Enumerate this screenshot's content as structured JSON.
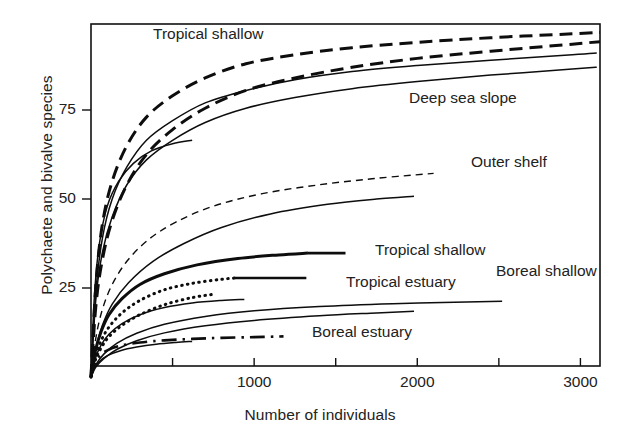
{
  "chart_data": {
    "type": "line",
    "title": "",
    "xlabel": "Number of individuals",
    "ylabel": "Polychaete and bivalve species",
    "xlim": [
      0,
      3120
    ],
    "ylim": [
      0,
      99
    ],
    "grid": false,
    "legend_position": "inline-annotations",
    "xticks": [
      {
        "value": 1000,
        "label": "1000"
      },
      {
        "value": 2000,
        "label": "2000"
      },
      {
        "value": 3000,
        "label": "3000"
      }
    ],
    "xminorticks": [
      500,
      1500,
      2500
    ],
    "yticks": [
      {
        "value": 25,
        "label": "25"
      },
      {
        "value": 50,
        "label": "50"
      },
      {
        "value": 75,
        "label": "75"
      }
    ],
    "annotations": [
      {
        "text": "Tropical shallow",
        "x": 720,
        "y": 96,
        "name": "label-tropical-shallow-top"
      },
      {
        "text": "Deep sea slope",
        "x": 2280,
        "y": 78,
        "name": "label-deep-sea-slope"
      },
      {
        "text": "Outer shelf",
        "x": 2560,
        "y": 60,
        "name": "label-outer-shelf"
      },
      {
        "text": "Tropical shallow",
        "x": 2080,
        "y": 35.5,
        "name": "label-tropical-shallow-mid"
      },
      {
        "text": "Boreal shallow",
        "x": 2790,
        "y": 29.5,
        "name": "label-boreal-shallow"
      },
      {
        "text": "Tropical estuary",
        "x": 1900,
        "y": 26.5,
        "name": "label-tropical-estuary"
      },
      {
        "text": "Boreal estuary",
        "x": 1660,
        "y": 12.5,
        "name": "label-boreal-estuary"
      }
    ],
    "series": [
      {
        "name": "Tropical shallow A",
        "style": "dashed-thick",
        "x": [
          0,
          30,
          70,
          130,
          220,
          340,
          500,
          700,
          950,
          1250,
          1600,
          2000,
          2450,
          2950,
          3120
        ],
        "values": [
          0,
          26,
          43,
          55,
          65,
          73,
          79,
          84,
          88,
          90.5,
          92.5,
          94,
          95.3,
          96.4,
          96.8
        ]
      },
      {
        "name": "Tropical shallow B",
        "style": "dashed-thick",
        "x": [
          0,
          30,
          70,
          130,
          220,
          340,
          500,
          700,
          950,
          1250,
          1600,
          2000,
          2450,
          2950,
          3120
        ],
        "values": [
          0,
          20,
          33,
          44,
          54,
          62.5,
          69.5,
          75.5,
          80.5,
          84,
          87,
          89.5,
          91.5,
          93.5,
          94.2
        ]
      },
      {
        "name": "Deep sea slope A",
        "style": "solid-thin",
        "x": [
          0,
          30,
          70,
          130,
          220,
          340,
          500,
          700,
          950,
          1250,
          1600,
          2000,
          2450,
          2950,
          3100
        ],
        "values": [
          0,
          24,
          39,
          50,
          59,
          66.5,
          72,
          77,
          80.5,
          83.5,
          85.8,
          87.5,
          89,
          90.5,
          91
        ]
      },
      {
        "name": "Deep sea slope B",
        "style": "solid-thin",
        "x": [
          0,
          30,
          70,
          130,
          220,
          340,
          500,
          700,
          950,
          1250,
          1600,
          2000,
          2450,
          2950,
          3100
        ],
        "values": [
          0,
          22,
          35,
          45,
          54,
          61,
          66.5,
          71.5,
          75.5,
          78.5,
          81,
          83,
          84.8,
          86.5,
          87
        ]
      },
      {
        "name": "Steep short solid",
        "style": "solid-thin",
        "x": [
          0,
          20,
          50,
          100,
          170,
          260,
          370,
          500,
          620
        ],
        "values": [
          0,
          22,
          37,
          48,
          55,
          60,
          63.5,
          65.5,
          66.5
        ]
      },
      {
        "name": "Outer shelf",
        "style": "dashed-thin",
        "x": [
          0,
          30,
          70,
          130,
          220,
          350,
          520,
          750,
          1050,
          1400,
          1750,
          2100
        ],
        "values": [
          0,
          11,
          19,
          26,
          32.5,
          38.5,
          43.5,
          48,
          51.5,
          54,
          55.8,
          57.2
        ]
      },
      {
        "name": "Mid solid long",
        "style": "solid-thin",
        "x": [
          0,
          30,
          70,
          130,
          230,
          380,
          570,
          800,
          1100,
          1450,
          1750,
          1980
        ],
        "values": [
          0,
          8,
          14.5,
          20.5,
          26.5,
          32.5,
          37.5,
          42,
          45.8,
          48.5,
          50,
          50.8
        ]
      },
      {
        "name": "Tropical shallow mid",
        "style": "solid-thick",
        "x": [
          0,
          25,
          60,
          110,
          190,
          300,
          450,
          650,
          900,
          1150,
          1330
        ],
        "values": [
          0,
          7,
          12.5,
          17.5,
          22,
          26,
          29,
          31.5,
          33.3,
          34.3,
          34.8
        ]
      },
      {
        "name": "Tropical estuary A",
        "style": "dotted",
        "x": [
          0,
          25,
          60,
          110,
          190,
          300,
          450,
          620,
          790,
          880
        ],
        "values": [
          0,
          5.5,
          10,
          14,
          18,
          21.5,
          24.5,
          26.3,
          27.4,
          27.8
        ]
      },
      {
        "name": "Tropical estuary B",
        "style": "dotted",
        "x": [
          0,
          25,
          60,
          110,
          190,
          300,
          450,
          620,
          760
        ],
        "values": [
          0,
          4.5,
          8,
          11.3,
          14.5,
          17.5,
          20.3,
          22.3,
          23.3
        ]
      },
      {
        "name": "Short solid mid-low",
        "style": "solid-thin",
        "x": [
          0,
          25,
          60,
          110,
          190,
          300,
          450,
          620,
          800,
          940
        ],
        "values": [
          0,
          5,
          8.8,
          12,
          15,
          17.5,
          19.5,
          20.8,
          21.5,
          21.8
        ]
      },
      {
        "name": "Boreal shallow A",
        "style": "solid-thin",
        "x": [
          0,
          30,
          80,
          160,
          280,
          450,
          700,
          1000,
          1400,
          1850,
          2300,
          2520
        ],
        "values": [
          0,
          3.5,
          6.5,
          9.5,
          12.3,
          14.8,
          17,
          18.6,
          19.8,
          20.6,
          21.1,
          21.3
        ]
      },
      {
        "name": "Boreal shallow B",
        "style": "solid-thin",
        "x": [
          0,
          30,
          80,
          160,
          280,
          450,
          700,
          1000,
          1400,
          1750,
          1980
        ],
        "values": [
          0,
          2.8,
          5.2,
          7.8,
          10.2,
          12.4,
          14.4,
          15.9,
          17.2,
          18,
          18.5
        ]
      },
      {
        "name": "Boreal estuary",
        "style": "dashdot",
        "x": [
          0,
          20,
          50,
          100,
          180,
          300,
          450,
          620,
          800,
          1000,
          1180
        ],
        "values": [
          0,
          3.5,
          5.8,
          7.5,
          8.8,
          9.7,
          10.3,
          10.7,
          11,
          11.2,
          11.4
        ]
      },
      {
        "name": "Low solid short",
        "style": "solid-thin",
        "x": [
          0,
          20,
          50,
          100,
          180,
          280,
          400,
          520,
          620
        ],
        "values": [
          0,
          2.5,
          4.3,
          6,
          7.4,
          8.4,
          9.2,
          9.7,
          10
        ]
      }
    ]
  }
}
